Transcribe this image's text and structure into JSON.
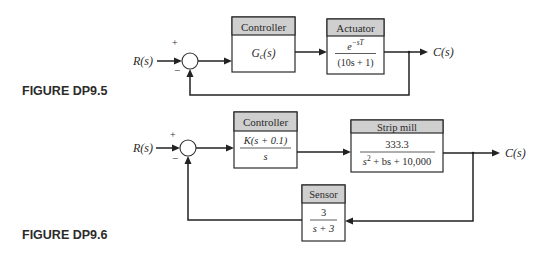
{
  "figures": [
    {
      "label": "FIGURE DP9.5",
      "input": "R(s)",
      "output": "C(s)",
      "sum_signs": {
        "top": "+",
        "bottom": "−"
      },
      "blocks": {
        "controller": {
          "title": "Controller",
          "tf": "Gc(s)",
          "tf_main": "G",
          "tf_sub": "c",
          "tf_tail": "(s)"
        },
        "actuator": {
          "title": "Actuator",
          "numerator_base": "e",
          "numerator_exp": "−sT",
          "denominator": "(10s + 1)"
        }
      },
      "feedback": "unity"
    },
    {
      "label": "FIGURE DP9.6",
      "input": "R(s)",
      "output": "C(s)",
      "sum_signs": {
        "top": "+",
        "bottom": "−"
      },
      "blocks": {
        "controller": {
          "title": "Controller",
          "numerator": "K(s + 0.1)",
          "denominator": "s"
        },
        "plant": {
          "title": "Strip mill",
          "numerator": "333.3",
          "denominator_pre": "s",
          "denominator_exp": "2",
          "denominator_post": " + bs + 10,000"
        },
        "sensor": {
          "title": "Sensor",
          "numerator": "3",
          "denominator": "s + 3"
        }
      },
      "feedback": "sensor"
    }
  ],
  "colors": {
    "header_fill": "#cfcfcf",
    "line": "#222222",
    "background": "#ffffff"
  }
}
